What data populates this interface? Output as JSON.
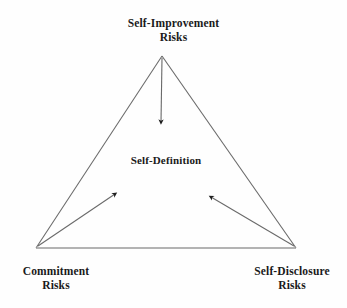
{
  "diagram": {
    "type": "triangle-relationship-diagram",
    "background_color": "#fefefe",
    "line_color": "#5a5a5a",
    "text_color": "#1a1a1a",
    "center": {
      "label_line1": "Self-Definition"
    },
    "vertices": [
      {
        "id": "self-improvement-risks",
        "position": "top",
        "label_line1": "Self-Improvement",
        "label_line2": "Risks"
      },
      {
        "id": "commitment-risks",
        "position": "bottom-left",
        "label_line1": "Commitment",
        "label_line2": "Risks"
      },
      {
        "id": "self-disclosure-risks",
        "position": "bottom-right",
        "label_line1": "Self-Disclosure",
        "label_line2": "Risks"
      }
    ],
    "arrows": [
      {
        "id": "arrow-top-to-center",
        "from": "self-improvement-risks",
        "to": "center",
        "direction": "down"
      },
      {
        "id": "arrow-bottom-left-to-center",
        "from": "commitment-risks",
        "to": "center",
        "direction": "up-right"
      },
      {
        "id": "arrow-bottom-right-to-center",
        "from": "self-disclosure-risks",
        "to": "center",
        "direction": "up-left"
      }
    ],
    "geometry": {
      "apex": [
        162,
        56
      ],
      "bottom_left": [
        36,
        248
      ],
      "bottom_right": [
        296,
        248
      ]
    }
  }
}
